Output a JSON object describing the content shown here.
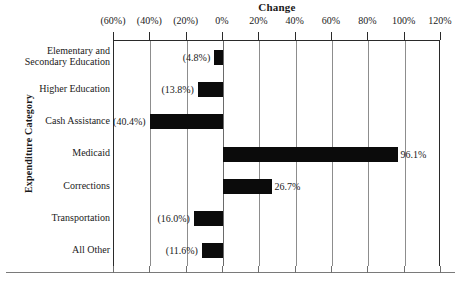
{
  "chart_data": {
    "type": "bar",
    "orientation": "horizontal",
    "title": "Change",
    "xlabel": "Change",
    "ylabel": "Expenditure Category",
    "categories": [
      "Elementary and Secondary Education",
      "Higher Education",
      "Cash Assistance",
      "Medicaid",
      "Corrections",
      "Transportation",
      "All Other"
    ],
    "values": [
      -4.8,
      -13.8,
      -40.4,
      96.1,
      26.7,
      -16.0,
      -11.6
    ],
    "value_labels": [
      "(4.8%)",
      "(13.8%)",
      "(40.4%)",
      "96.1%",
      "26.7%",
      "(16.0%)",
      "(11.6%)"
    ],
    "xlim": [
      -60,
      120
    ],
    "xtick_values": [
      -60,
      -40,
      -20,
      0,
      20,
      40,
      60,
      80,
      100,
      120
    ],
    "xtick_labels": [
      "(60%)",
      "(40%)",
      "(20%)",
      "0%",
      "20%",
      "40%",
      "60%",
      "80%",
      "100%",
      "120%"
    ],
    "grid": true,
    "legend": false,
    "bar_color": "#0b0b0b",
    "grid_color": "#8d8d8d",
    "axis_color": "#2a2a2a"
  },
  "categories_display": [
    {
      "line1": "Elementary and",
      "line2": "Secondary Education"
    },
    {
      "line1": "Higher Education",
      "line2": ""
    },
    {
      "line1": "Cash Assistance",
      "line2": ""
    },
    {
      "line1": "Medicaid",
      "line2": ""
    },
    {
      "line1": "Corrections",
      "line2": ""
    },
    {
      "line1": "Transportation",
      "line2": ""
    },
    {
      "line1": "All Other",
      "line2": ""
    }
  ]
}
